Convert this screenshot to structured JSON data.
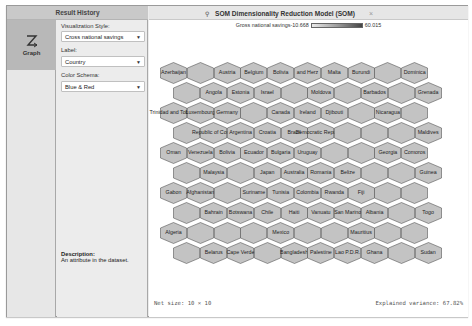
{
  "result_history": {
    "title": "Result History",
    "items": [
      {
        "label": "Graph",
        "icon": "graph-icon"
      }
    ]
  },
  "settings": {
    "visualization_style": {
      "label": "Visualization Style:",
      "value": "Cross national savings"
    },
    "label": {
      "label": "Label:",
      "value": "Country"
    },
    "color_schema": {
      "label": "Color Schema:",
      "value": "Blue & Red"
    },
    "description": {
      "title": "Description:",
      "text": "An attribute in the dataset."
    }
  },
  "view": {
    "tab": {
      "title": "SOM Dimensionality Reduction Model (SOM)",
      "icon": "model-icon",
      "close": "×"
    },
    "legend": {
      "label": "Gross national savings",
      "min": "-10.668",
      "max": "60.015"
    },
    "footer": {
      "net_size": "Net size: 10 × 10",
      "explained_variance": "Explained variance: 67.82%"
    },
    "som": {
      "rows": 10,
      "cols": 10,
      "cells": [
        [
          "Azerbaijan",
          "",
          "Austria",
          "Belgium",
          "Bolivia",
          "and Herz",
          "Malta",
          "Burundi",
          "",
          "Dominica"
        ],
        [
          "",
          "Angola",
          "Estonia",
          "Israel",
          "",
          "Moldova",
          "",
          "Barbados",
          "",
          "Grenada"
        ],
        [
          "Trinidad and Tobago",
          "Luxembourg",
          "Germany",
          "",
          "Canada",
          "Ireland",
          "Djibouti",
          "",
          "Nicaragua",
          ""
        ],
        [
          "",
          "Republic of Congo",
          "Argentina",
          "Croatia",
          "Brazil",
          "Democratic Republic of",
          "",
          "",
          "",
          "Maldives"
        ],
        [
          "Oman",
          "Venezuela",
          "Bolivia",
          "Ecuador",
          "Bulgaria",
          "Uruguay",
          "",
          "",
          "Georgia",
          "Comoros"
        ],
        [
          "",
          "Malaysia",
          "",
          "Japan",
          "Australia",
          "Romania",
          "Belize",
          "",
          "",
          "Guinea"
        ],
        [
          "Gabon",
          "Afghanistan",
          "",
          "Suriname",
          "Tunisia",
          "Colombia",
          "Rwanda",
          "Fiji",
          "",
          ""
        ],
        [
          "",
          "Bahrain",
          "Botswana",
          "Chile",
          "Haiti",
          "Vanuatu",
          "San Marino",
          "Albania",
          "",
          "Togo",
          "Benin"
        ],
        [
          "Algeria",
          "",
          "",
          "",
          "Mexico",
          "",
          "",
          "Mauritius",
          "",
          ""
        ],
        [
          "",
          "Belarus",
          "Cape Verde",
          "",
          "Bangladesh",
          "Palestine",
          "Lao P.D.R.",
          "Ghana",
          "",
          "Sudan",
          "Burkina Faso"
        ]
      ],
      "hex_fill": "#c3c3c3",
      "hex_stroke": "#555555"
    }
  }
}
